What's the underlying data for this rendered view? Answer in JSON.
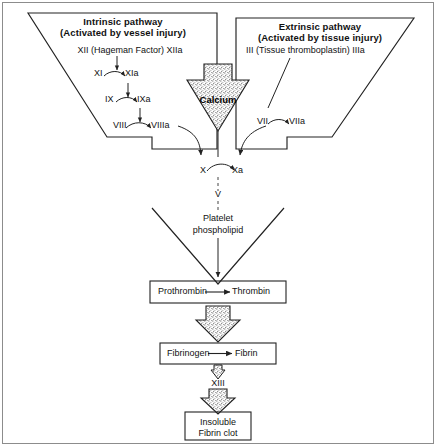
{
  "figure": {
    "frame_color": "#8c8c8c",
    "line_color": "#222222",
    "stipple_color": "#bfbfbf"
  },
  "intrinsic": {
    "heading_line1": "Intrinsic pathway",
    "heading_line2": "(Activated by vessel injury)",
    "steps": [
      {
        "id": "xii",
        "inactive": "XII (Hageman Factor)",
        "active": "XIIa",
        "full": "XII (Hageman Factor) XIIa"
      },
      {
        "id": "xi",
        "inactive": "XI",
        "active": "XIa",
        "full": "XI⌒XIa"
      },
      {
        "id": "ix",
        "inactive": "IX",
        "active": "IXa",
        "full": "IX⌒IXa"
      },
      {
        "id": "viii",
        "inactive": "VIII",
        "active": "VIIIa",
        "full": "VIII⌒VIIIa"
      }
    ]
  },
  "extrinsic": {
    "heading_line1": "Extrinsic pathway",
    "heading_line2": "(Activated by tissue injury)",
    "steps": [
      {
        "id": "iii",
        "inactive": "III (Tissue thromboplastin)",
        "active": "IIIa",
        "full": "III (Tissue thromboplastin) IIIa"
      },
      {
        "id": "vii",
        "inactive": "VII",
        "active": "VIIa",
        "full": "VII⌒VIIa"
      }
    ]
  },
  "common": {
    "calcium_label": "Calcium",
    "factor_x_inactive": "X",
    "factor_x_active": "Xa",
    "factor_v": "V",
    "platelet_line1": "Platelet",
    "platelet_line2": "phospholipid",
    "factor_xiii": "XIII"
  },
  "boxes": [
    {
      "id": "prothrombin",
      "left": "Prothrombin",
      "right": "Thrombin",
      "arrow": "→"
    },
    {
      "id": "fibrinogen",
      "left": "Fibrinogen",
      "right": "Fibrin",
      "arrow": "→"
    },
    {
      "id": "clot",
      "line1": "Insoluble",
      "line2": "Fibrin clot"
    }
  ],
  "icons": {
    "calcium_arrow": "down-block-arrow-icon",
    "thrombin_arrow": "down-block-arrow-icon",
    "xiii_arrow": "down-block-arrow-icon",
    "clot_arrow": "down-block-arrow-icon"
  }
}
